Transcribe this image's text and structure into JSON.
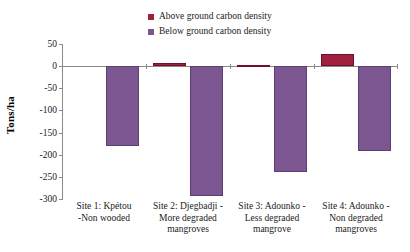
{
  "chart_data": {
    "type": "bar",
    "title": "",
    "xlabel": "",
    "ylabel": "Tons/ha",
    "ylim": [
      -300,
      50
    ],
    "yticks": [
      50,
      0,
      -50,
      -100,
      -150,
      -200,
      -250,
      -300
    ],
    "ytick_labels": [
      "50",
      "0",
      "-50",
      "-100",
      "-150",
      "-200",
      "-250",
      "-300"
    ],
    "grid": false,
    "legend_position": "top-center",
    "categories": [
      "Site 1: Kpétou -Non wooded",
      "Site 2: Djegbadji - More degraded mangroves",
      "Site 3: Adounko - Less degraded mangrove",
      "Site 4: Adounko - Non degraded mangroves"
    ],
    "category_lines": [
      [
        "Site 1: Kpétou",
        "-Non wooded"
      ],
      [
        "Site 2: Djegbadji -",
        "More degraded",
        "mangroves"
      ],
      [
        "Site 3: Adounko -",
        "Less degraded",
        "mangrove"
      ],
      [
        "Site 4: Adounko -",
        "Non degraded",
        "mangroves"
      ]
    ],
    "series": [
      {
        "name": "Above ground carbon density",
        "color": "#a02040",
        "values": [
          0,
          6,
          3,
          27
        ]
      },
      {
        "name": "Below ground carbon density",
        "color": "#7b5690",
        "values": [
          -181,
          -293,
          -238,
          -192
        ]
      }
    ]
  },
  "legend": {
    "items": [
      {
        "label": "Above ground carbon density",
        "color": "#a02040"
      },
      {
        "label": "Below ground carbon density",
        "color": "#7b5690"
      }
    ]
  }
}
